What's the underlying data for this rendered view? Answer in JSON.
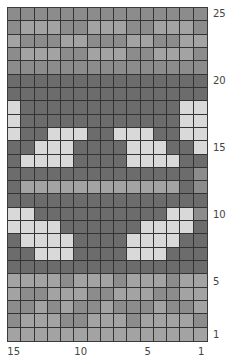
{
  "chart_data": {
    "type": "heatmap",
    "title": "",
    "columns": 15,
    "rows": 25,
    "column_numbering": "right-to-left",
    "row_numbering": "bottom-to-top",
    "x_tick_labels": [
      "15",
      "10",
      "5",
      "1"
    ],
    "x_tick_positions": [
      15,
      10,
      5,
      1
    ],
    "y_tick_labels": [
      "25",
      "20",
      "15",
      "10",
      "5",
      "1"
    ],
    "y_tick_positions": [
      25,
      20,
      15,
      10,
      5,
      1
    ],
    "legend": {
      "L": "light",
      "M": "medium",
      "m": "medium-light",
      "D": "dark"
    },
    "colors": {
      "L": "#d9d9d9",
      "m": "#a3a3a3",
      "M": "#8c8c8c",
      "D": "#6c6c6c",
      "grid_line": "#333333"
    },
    "grid_rows_top_to_bottom": [
      {
        "row": 25,
        "cells": "MMMMMMMMMMMMMMM"
      },
      {
        "row": 24,
        "cells": "MmmmMMmmmMMmmmM"
      },
      {
        "row": 23,
        "cells": "mMMMmmMMMmmMMmm"
      },
      {
        "row": 22,
        "cells": "MmmmMMmmmMMmmmM"
      },
      {
        "row": 21,
        "cells": "MMMMMMMMMMMMMMM"
      },
      {
        "row": 20,
        "cells": "DDDDDDDDDDDDDDD"
      },
      {
        "row": 19,
        "cells": "DDDDDDDDDDDDDDD"
      },
      {
        "row": 18,
        "cells": "LDDDDDDDDDDDDLL"
      },
      {
        "row": 17,
        "cells": "LDDDDDDDDDDDDLL"
      },
      {
        "row": 16,
        "cells": "LDDLLLDDLLLDDLL"
      },
      {
        "row": 15,
        "cells": "DDLLLDDDDLLLDDL"
      },
      {
        "row": 14,
        "cells": "DLLLLDDDDLLLLDD"
      },
      {
        "row": 13,
        "cells": "DDDDDDDDDDDDDDM"
      },
      {
        "row": 12,
        "cells": "DmmmmmmmmmmmmDM"
      },
      {
        "row": 11,
        "cells": "DDDDDDDDDDDDDDD"
      },
      {
        "row": 10,
        "cells": "LLDDDDDDDDDDLLM"
      },
      {
        "row": 9,
        "cells": "LLLLDDDDDDLLLLD"
      },
      {
        "row": 8,
        "cells": "DLLLLDDDDLLLLDD"
      },
      {
        "row": 7,
        "cells": "DDLLLDDDDLLLDDD"
      },
      {
        "row": 6,
        "cells": "DDDDDDDDDDDDDDD"
      },
      {
        "row": 5,
        "cells": "mmmmMmmmMmmmMmm"
      },
      {
        "row": 4,
        "cells": "mMMmmmMMmmmMMmm"
      },
      {
        "row": 3,
        "cells": "MMmMmMMmMMMmMMm"
      },
      {
        "row": 2,
        "cells": "MmmmMMmmmMmmmmM"
      },
      {
        "row": 1,
        "cells": "mmmmmmmmmmmmmmm"
      }
    ]
  }
}
